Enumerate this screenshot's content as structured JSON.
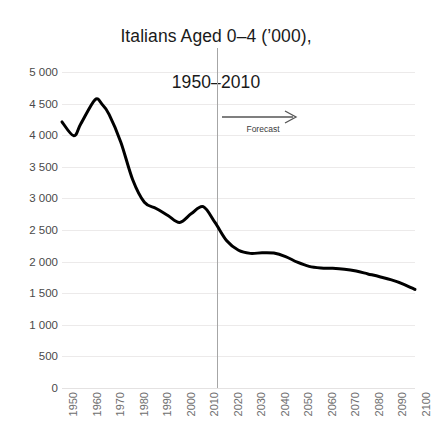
{
  "chart_data": {
    "type": "line",
    "title": "Italians Aged 0–4 (’000),\n1950–2010",
    "title_line1": "Italians Aged 0–4 (’000),",
    "title_line2": "1950–2010",
    "xlabel": "",
    "ylabel": "",
    "ylim": [
      0,
      5000
    ],
    "xlim": [
      1950,
      2100
    ],
    "ytick_step": 500,
    "grid": true,
    "legend": false,
    "y_ticks": [
      0,
      500,
      1000,
      1500,
      2000,
      2500,
      3000,
      3500,
      4000,
      4500,
      5000
    ],
    "y_tick_labels": [
      "0",
      "500",
      "1 000",
      "1 500",
      "2 000",
      "2 500",
      "3 000",
      "3 500",
      "4 000",
      "4 500",
      "5 000"
    ],
    "x_ticks": [
      1950,
      1960,
      1970,
      1980,
      1990,
      2000,
      2010,
      2020,
      2030,
      2040,
      2050,
      2060,
      2070,
      2080,
      2090,
      2100
    ],
    "x_tick_labels": [
      "1950",
      "1960",
      "1970",
      "1980",
      "1990",
      "2000",
      "2010",
      "2020",
      "2030",
      "2040",
      "2050",
      "2060",
      "2070",
      "2080",
      "2090",
      "2100"
    ],
    "series": [
      {
        "name": "Italians aged 0-4",
        "color": "#000000",
        "line_width": 3,
        "x": [
          1950,
          1955,
          1958,
          1964,
          1967,
          1970,
          1975,
          1980,
          1985,
          1990,
          1995,
          2000,
          2005,
          2010,
          2015,
          2020,
          2025,
          2030,
          2035,
          2040,
          2045,
          2050,
          2055,
          2060,
          2065,
          2070,
          2075,
          2080,
          2085,
          2090,
          2095,
          2100
        ],
        "values": [
          4210,
          3990,
          4180,
          4560,
          4490,
          4330,
          3890,
          3300,
          2940,
          2840,
          2730,
          2620,
          2760,
          2870,
          2620,
          2330,
          2180,
          2130,
          2140,
          2135,
          2080,
          1990,
          1925,
          1900,
          1895,
          1880,
          1850,
          1805,
          1760,
          1710,
          1645,
          1560
        ]
      }
    ],
    "annotations": [
      {
        "type": "vline",
        "name": "forecast-divider",
        "x": 2020,
        "color": "#a6a6a6"
      },
      {
        "type": "arrow-label",
        "name": "forecast-annotation",
        "label": "Forecast",
        "direction": "right",
        "from_x": 2020,
        "to_x": 2055,
        "color": "#3b3b3b"
      }
    ],
    "colors": {
      "series": "#000000",
      "grid": "#eceaea",
      "divider": "#a6a6a6",
      "title_text": "#1a1a1a",
      "tick_text": "#4a4a4a",
      "xtick_text": "#6e6e6e",
      "background": "#ffffff"
    }
  }
}
